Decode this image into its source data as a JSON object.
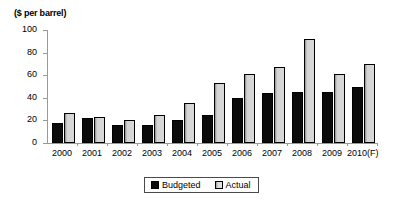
{
  "chart_data": {
    "type": "bar",
    "title": "",
    "xlabel": "",
    "ylabel": "($ per barrel)",
    "ylim": [
      0,
      100
    ],
    "ytick_values": [
      0,
      20,
      40,
      60,
      80,
      100
    ],
    "ytick_labels": [
      "0",
      "20",
      "40",
      "60",
      "80",
      "100"
    ],
    "grid": false,
    "legend_position": "bottom-center",
    "categories": [
      "2000",
      "2001",
      "2002",
      "2003",
      "2004",
      "2005",
      "2006",
      "2007",
      "2008",
      "2009",
      "2010(F)"
    ],
    "series": [
      {
        "name": "Budgeted",
        "color": "#0b0b0b",
        "values": [
          18,
          22,
          16,
          16,
          20,
          25,
          40,
          44,
          45,
          45,
          50
        ]
      },
      {
        "name": "Actual",
        "color": "#d9d9d9",
        "values": [
          27,
          23,
          20,
          25,
          35,
          53,
          61,
          67,
          92,
          61,
          70
        ]
      }
    ]
  },
  "legend": {
    "items": [
      {
        "label": "Budgeted",
        "swatch": "black-square-icon"
      },
      {
        "label": "Actual",
        "swatch": "gray-square-icon"
      }
    ]
  }
}
